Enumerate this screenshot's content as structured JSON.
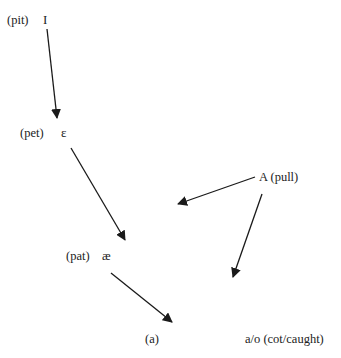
{
  "diagram": {
    "nodes": [
      {
        "id": "pit",
        "word": "(pit)",
        "symbol": "I"
      },
      {
        "id": "pet",
        "word": "(pet)",
        "symbol": "ɛ"
      },
      {
        "id": "pat",
        "word": "(pat)",
        "symbol": "æ"
      },
      {
        "id": "a",
        "word": "(a)",
        "symbol": ""
      },
      {
        "id": "ao",
        "word": "a/o (cot/caught)",
        "symbol": ""
      },
      {
        "id": "pull",
        "word": "A (pull)",
        "symbol": ""
      }
    ],
    "edges": [
      {
        "from": "pit",
        "to": "pet"
      },
      {
        "from": "pet",
        "to": "pat"
      },
      {
        "from": "pat",
        "to": "a"
      },
      {
        "from": "pull",
        "to": "left-shift"
      },
      {
        "from": "pull",
        "to": "ao"
      }
    ],
    "colors": {
      "arrow": "#1a1a1a",
      "text": "#222222"
    }
  }
}
